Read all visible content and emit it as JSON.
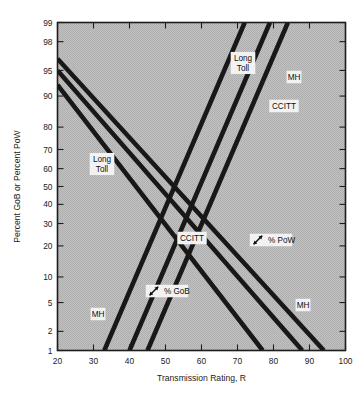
{
  "figure": {
    "background_color": "#ffffff",
    "plot_background_color": "#b9b9b9",
    "line_color": "#181818",
    "axis_color": "#1d1d1d"
  },
  "chart_data": {
    "type": "line",
    "title": "",
    "subtitle": "",
    "xlabel": "Transmission Rating, R",
    "ylabel": "Percent GoB or Percent PoW",
    "xlim": [
      20,
      100
    ],
    "ylim": [
      1,
      99
    ],
    "yscale": "probability (normal probit)",
    "xscale": "linear",
    "grid": false,
    "legend_position": "inline-annotations",
    "xticks": [
      20,
      30,
      40,
      50,
      60,
      70,
      80,
      90,
      100
    ],
    "xticklabels": [
      "20",
      "30",
      "40",
      "50",
      "60",
      "70",
      "80",
      "90",
      "100"
    ],
    "yticks": [
      1,
      2,
      5,
      10,
      20,
      30,
      40,
      50,
      60,
      70,
      80,
      90,
      95,
      98,
      99
    ],
    "yticklabels": [
      "1",
      "2",
      "5",
      "10",
      "20",
      "30",
      "40",
      "50",
      "60",
      "70",
      "80",
      "90",
      "95",
      "98",
      "99"
    ],
    "series": [
      {
        "name": "Long Toll (% GoB)",
        "group": "GoB",
        "direction": "decreasing",
        "points": [
          [
            20,
            96.5
          ],
          [
            94,
            1.0
          ]
        ]
      },
      {
        "name": "CCITT (% GoB)",
        "group": "GoB",
        "direction": "decreasing",
        "points": [
          [
            20,
            95.0
          ],
          [
            88,
            1.0
          ]
        ]
      },
      {
        "name": "MH (% GoB)",
        "group": "GoB",
        "direction": "decreasing",
        "points": [
          [
            20,
            92.5
          ],
          [
            77,
            1.0
          ]
        ]
      },
      {
        "name": "Long Toll (% PoW)",
        "group": "PoW",
        "direction": "increasing",
        "points": [
          [
            33,
            1.0
          ],
          [
            72,
            99.0
          ]
        ]
      },
      {
        "name": "CCITT (% PoW)",
        "group": "PoW",
        "direction": "increasing",
        "points": [
          [
            40,
            1.0
          ],
          [
            79,
            99.0
          ]
        ]
      },
      {
        "name": "MH (% PoW)",
        "group": "PoW",
        "direction": "increasing",
        "points": [
          [
            45,
            1.0
          ],
          [
            84,
            99.0
          ]
        ]
      }
    ],
    "annotations": [
      {
        "id": "long-toll-upper",
        "text_lines": [
          "Long",
          "Toll"
        ],
        "x": 243,
        "y": 63,
        "icon": "none"
      },
      {
        "id": "mh-upper",
        "text_lines": [
          "MH"
        ],
        "x": 294,
        "y": 77,
        "icon": "none"
      },
      {
        "id": "ccitt-upper",
        "text_lines": [
          "CCITT"
        ],
        "x": 284,
        "y": 106,
        "icon": "none"
      },
      {
        "id": "long-toll-left",
        "text_lines": [
          "Long",
          "Toll"
        ],
        "x": 102,
        "y": 164,
        "icon": "none"
      },
      {
        "id": "ccitt-middle",
        "text_lines": [
          "CCITT"
        ],
        "x": 192,
        "y": 238,
        "icon": "none"
      },
      {
        "id": "pow-callout",
        "text_lines": [
          "% PoW"
        ],
        "x": 271,
        "y": 240,
        "icon": "double-arrow-icon"
      },
      {
        "id": "gob-callout",
        "text_lines": [
          "% GoB"
        ],
        "x": 167,
        "y": 291,
        "icon": "double-arrow-icon"
      },
      {
        "id": "mh-lower-left",
        "text_lines": [
          "MH"
        ],
        "x": 98,
        "y": 314,
        "icon": "none"
      },
      {
        "id": "mh-lower-right",
        "text_lines": [
          "MH"
        ],
        "x": 303,
        "y": 305,
        "icon": "none"
      }
    ]
  }
}
